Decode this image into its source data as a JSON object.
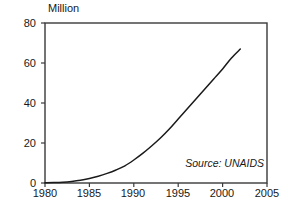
{
  "chart_data": {
    "type": "line",
    "title": "",
    "subtitle": "",
    "xlabel": "",
    "ylabel": "Million",
    "unit_label": "Million",
    "xlim": [
      1980,
      2005
    ],
    "ylim": [
      0,
      80
    ],
    "grid": false,
    "legend": false,
    "legend_position": "none",
    "annotations": [
      {
        "name": "source",
        "text": "Source: UNAIDS",
        "style": "italic",
        "position": "inside-bottom-right"
      }
    ],
    "x_ticks": [
      1980,
      1985,
      1990,
      1995,
      2000,
      2005
    ],
    "x_tick_labels": [
      "1980",
      "1985",
      "1990",
      "1995",
      "2000",
      "2005"
    ],
    "y_ticks": [
      0,
      20,
      40,
      60,
      80
    ],
    "y_tick_labels": [
      "0",
      "20",
      "40",
      "60",
      "80"
    ],
    "series": [
      {
        "name": "People living with HIV/AIDS",
        "color": "#1a1a1a",
        "x": [
          1980,
          1981,
          1982,
          1983,
          1984,
          1985,
          1986,
          1987,
          1988,
          1989,
          1990,
          1991,
          1992,
          1993,
          1994,
          1995,
          1996,
          1997,
          1998,
          1999,
          2000,
          2001,
          2002
        ],
        "values": [
          0.1,
          0.2,
          0.4,
          0.8,
          1.4,
          2.3,
          3.4,
          4.8,
          6.5,
          8.6,
          11.5,
          14.8,
          18.5,
          22.5,
          27.0,
          32.0,
          37.0,
          42.0,
          47.0,
          52.0,
          57.0,
          62.5,
          67.0
        ]
      }
    ]
  },
  "plot_geometry": {
    "left_px": 45,
    "right_px": 267,
    "top_px": 23,
    "bottom_px": 183
  },
  "colors": {
    "frame": "#3a3a3a",
    "line": "#1a1a1a",
    "background": "#ffffff",
    "text": "#181818"
  }
}
